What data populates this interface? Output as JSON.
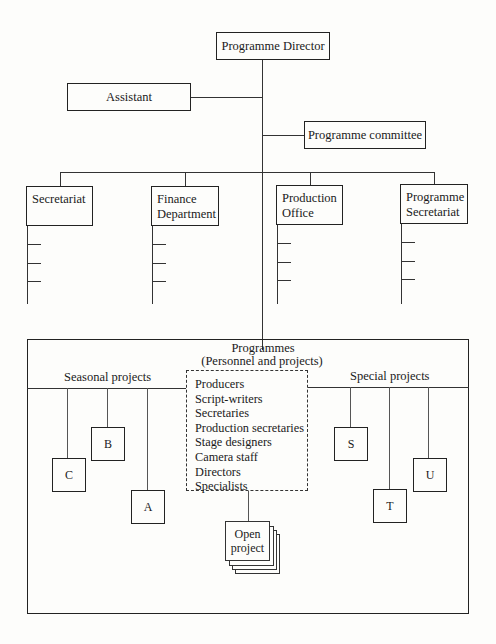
{
  "diagram": {
    "type": "organizational-chart",
    "top": {
      "director": "Programme Director",
      "assistant": "Assistant",
      "committee": "Programme committee"
    },
    "departments": [
      {
        "line1": "Secretariat",
        "line2": ""
      },
      {
        "line1": "Finance",
        "line2": "Department"
      },
      {
        "line1": "Production",
        "line2": "Office"
      },
      {
        "line1": "Programme",
        "line2": "Secretariat"
      }
    ],
    "programmes": {
      "title": "Programmes",
      "subtitle": "(Personnel and projects)",
      "seasonal_label": "Seasonal projects",
      "special_label": "Special projects",
      "staff": [
        "Producers",
        "Script-writers",
        "Secretaries",
        "Production secretaries",
        "Stage designers",
        "Camera staff",
        "Directors",
        "Specialists"
      ],
      "seasonal_projects": [
        "C",
        "B",
        "A"
      ],
      "special_projects": [
        "S",
        "T",
        "U"
      ],
      "open_project": {
        "line1": "Open",
        "line2": "project"
      }
    }
  }
}
